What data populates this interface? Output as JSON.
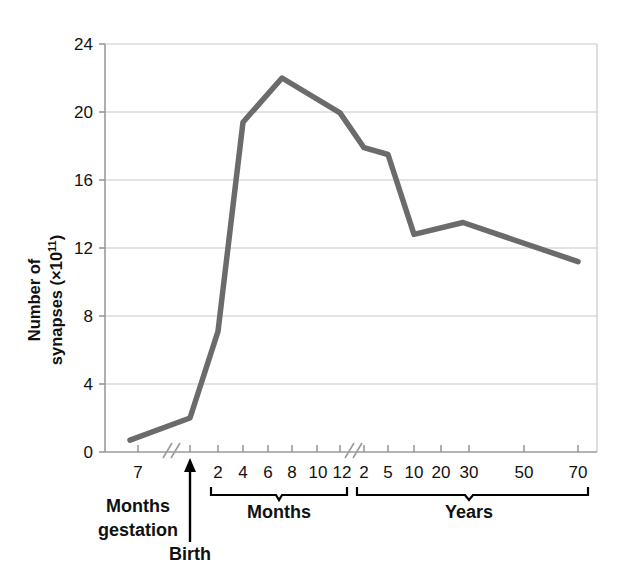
{
  "chart_data": {
    "type": "line",
    "title": "",
    "xlabel": "",
    "ylabel": "Number of synapses (×10¹¹)",
    "ylabel_line1": "Number of",
    "ylabel_line2_prefix": "synapses (×10",
    "ylabel_line2_exponent": "11",
    "ylabel_line2_suffix": ")",
    "ylim": [
      0,
      24
    ],
    "yticks": [
      0,
      4,
      8,
      12,
      16,
      20,
      24
    ],
    "ytick_labels": [
      "0",
      "4",
      "8",
      "12",
      "16",
      "20",
      "24"
    ],
    "grid": "horizontal",
    "legend": "none",
    "line_color": "#6b6b6b",
    "axis_color": "#9a9a9a",
    "grid_color": "#c8c8c8",
    "x_axis_segments": [
      {
        "name": "gestation",
        "group_label": "",
        "bracket": false,
        "tick_labels": [
          "7"
        ]
      },
      {
        "name": "birth",
        "group_label": "Birth",
        "bracket": false,
        "tick_labels": []
      },
      {
        "name": "months",
        "group_label": "Months",
        "bracket": true,
        "tick_labels": [
          "2",
          "4",
          "6",
          "8",
          "10",
          "12"
        ]
      },
      {
        "name": "years",
        "group_label": "Years",
        "bracket": true,
        "tick_labels": [
          "2",
          "5",
          "10",
          "20",
          "30",
          "50",
          "70"
        ]
      }
    ],
    "caption_gestation_line1": "Months",
    "caption_gestation_line2": "gestation",
    "caption_birth": "Birth",
    "caption_months": "Months",
    "caption_years": "Years",
    "axis_breaks": 2,
    "points": [
      {
        "label": "7 months gestation",
        "segment": "gestation",
        "x_label": "7",
        "y": 0.7
      },
      {
        "label": "Birth",
        "segment": "birth",
        "x_label": "Birth",
        "y": 2.0
      },
      {
        "label": "2 months",
        "segment": "months",
        "x_label": "2",
        "y": 7.1
      },
      {
        "label": "4 months",
        "segment": "months",
        "x_label": "4",
        "y": 19.4
      },
      {
        "label": "8 months",
        "segment": "months",
        "x_label": "8",
        "y": 22.0
      },
      {
        "label": "2 years",
        "segment": "years",
        "x_label": "2",
        "y": 17.9
      },
      {
        "label": "5 years",
        "segment": "years",
        "x_label": "5",
        "y": 17.5
      },
      {
        "label": "10 years",
        "segment": "years",
        "x_label": "10",
        "y": 12.8
      },
      {
        "label": "25 years",
        "segment": "years",
        "x_label": "25",
        "y": 13.5
      },
      {
        "label": "70 years",
        "segment": "years",
        "x_label": "70",
        "y": 11.2
      }
    ]
  }
}
